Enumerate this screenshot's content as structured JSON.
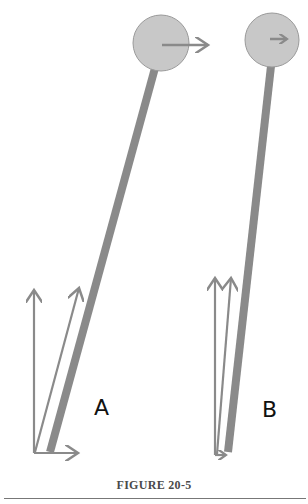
{
  "figure": {
    "caption": "FIGURE 20-5",
    "panels": [
      {
        "label": "A",
        "description": "Tilted pendulum with large horizontal arrow at bob; vector decomposition at base with vertical, angled and horizontal arrows"
      },
      {
        "label": "B",
        "description": "Nearly upright pendulum with small horizontal arrow at bob; nearly parallel vertical vectors at base with tiny horizontal component"
      }
    ]
  },
  "colors": {
    "stick": "#8a8a8a",
    "bob_fill": "#c8c8c8",
    "bob_stroke": "#8a8a8a",
    "arrow": "#8a8a8a",
    "label": "#111111"
  }
}
